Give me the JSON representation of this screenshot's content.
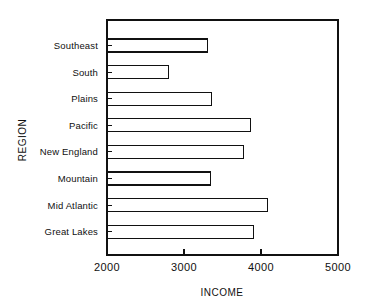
{
  "chart_data": {
    "type": "bar",
    "orientation": "horizontal",
    "title": "",
    "xlabel": "INCOME",
    "ylabel": "REGION",
    "categories": [
      "Southeast",
      "South",
      "Plains",
      "Pacific",
      "New England",
      "Mountain",
      "Mid Atlantic",
      "Great Lakes"
    ],
    "values": [
      3300,
      2800,
      3360,
      3860,
      3770,
      3340,
      4080,
      3900
    ],
    "xlim": [
      2000,
      5000
    ],
    "xticks": [
      2000,
      3000,
      4000,
      5000
    ],
    "xtick_labels": [
      "2000",
      "3000",
      "4000",
      "5000"
    ],
    "grid": false,
    "legend": null,
    "bar_fill": "#ffffff",
    "bar_stroke": "#111111",
    "axis_color": "#111111",
    "background": "#ffffff"
  },
  "figure": {
    "plot_left": 107,
    "plot_right": 338,
    "plot_top": 20,
    "plot_bottom": 255,
    "bar_height": 13,
    "row_pitch": 26.6,
    "first_row_center": 45.5
  }
}
